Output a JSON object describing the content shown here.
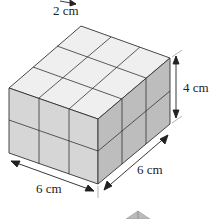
{
  "figure": {
    "labels": {
      "cube_edge": "2 cm",
      "height": "4 cm",
      "front_width": "6 cm",
      "side_depth": "6 cm"
    },
    "grid": {
      "columns_front": 3,
      "columns_side": 3,
      "layers": 2
    },
    "colors": {
      "top_face": "#efefef",
      "left_face": "#d6d6d6",
      "right_face": "#bdbdbd",
      "edge": "#333333"
    }
  }
}
